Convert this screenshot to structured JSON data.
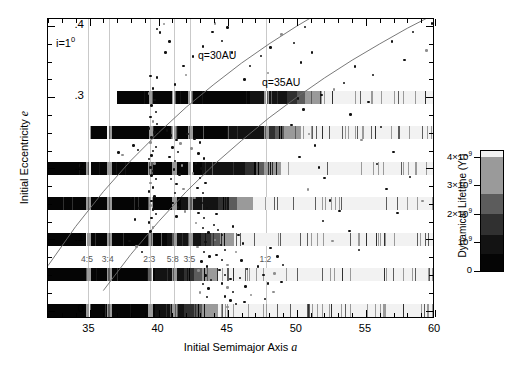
{
  "figure": {
    "x_axis": {
      "title_text": "Initial Semimajor Axis ",
      "title_symbol": "a",
      "min": 32.0,
      "max": 60.0,
      "ticks_major": [
        35,
        40,
        45,
        50,
        55,
        60
      ],
      "tick_labels": [
        "35",
        "40",
        "45",
        "50",
        "55",
        "60"
      ],
      "minor_step": 1
    },
    "y_axis": {
      "title_text": "Initial Eccentricity ",
      "title_symbol": "e",
      "min": -0.012,
      "max": 0.41,
      "ticks_major": [
        0,
        0.1,
        0.2,
        0.3,
        0.4
      ],
      "tick_labels": [
        "0",
        ".1",
        ".2",
        ".3",
        ".4"
      ],
      "minor_step": 0.025
    },
    "annotations": {
      "inclination": "i=1",
      "inclination_exponent": "0",
      "q30_label": "q=30AU",
      "q35_label": "q=35AU"
    },
    "resonance_labels": [
      {
        "text": "4:5",
        "a": 34.9,
        "e": 0.072
      },
      {
        "text": "3:4",
        "a": 36.4,
        "e": 0.072
      },
      {
        "text": "2:3",
        "a": 39.4,
        "e": 0.072
      },
      {
        "text": "5:8",
        "a": 41.1,
        "e": 0.072
      },
      {
        "text": "3:5",
        "a": 42.3,
        "e": 0.072
      },
      {
        "text": "1:2",
        "a": 47.8,
        "e": 0.072
      }
    ],
    "colorbar": {
      "title": "Dynamical Lifetime (Yr)",
      "min": 0,
      "max": 4200000000.0,
      "tick_values": [
        0,
        1000000000.0,
        2000000000.0,
        3000000000.0,
        4000000000.0
      ],
      "tick_labels": [
        "0",
        "10",
        "2×10",
        "3×10",
        "4×10"
      ],
      "tick_exponents": [
        "",
        "9",
        "9",
        "9",
        "9"
      ],
      "bands": [
        {
          "from": 0.0,
          "to": 620000000.0,
          "color": "#050505"
        },
        {
          "from": 620000000.0,
          "to": 1280000000.0,
          "color": "#131313"
        },
        {
          "from": 1280000000.0,
          "to": 2020000000.0,
          "color": "#303030"
        },
        {
          "from": 2020000000.0,
          "to": 2700000000.0,
          "color": "#5c5c5c"
        },
        {
          "from": 2700000000.0,
          "to": 4020000000.0,
          "color": "#9a9a9a"
        },
        {
          "from": 4020000000.0,
          "to": 4200000000.0,
          "color": "#f2f2f2"
        }
      ]
    }
  },
  "chart_data": {
    "type": "scatter",
    "title": "",
    "xlabel": "Initial Semimajor Axis a",
    "ylabel": "Initial Eccentricity e",
    "xlim": [
      32.0,
      60.0
    ],
    "ylim": [
      -0.012,
      0.41
    ],
    "grid": "vertical-resonance-lines",
    "legend": "colorbar-right",
    "resonance_gridlines_a": [
      34.9,
      36.4,
      39.4,
      41.1,
      42.3,
      47.8
    ],
    "curves": [
      {
        "name": "q=30AU",
        "label": "q=30AU",
        "comment": "perihelion q = a(1-e) = 30 AU",
        "q": 30,
        "points_a": [
          32,
          34,
          36,
          38,
          40,
          42,
          44,
          46,
          48,
          50,
          52,
          54,
          56,
          58,
          60
        ],
        "points_e": [
          0.063,
          0.118,
          0.167,
          0.211,
          0.25,
          0.286,
          0.318,
          0.348,
          0.375,
          0.4,
          0.423,
          0.444,
          0.464,
          0.483,
          0.5
        ]
      },
      {
        "name": "q=35AU",
        "label": "q=35AU",
        "comment": "perihelion q = a(1-e) = 35 AU",
        "q": 35,
        "points_a": [
          36,
          38,
          40,
          42,
          44,
          46,
          48,
          50,
          52,
          54,
          56,
          58,
          60
        ],
        "points_e": [
          0.028,
          0.079,
          0.125,
          0.167,
          0.205,
          0.239,
          0.271,
          0.3,
          0.327,
          0.352,
          0.375,
          0.397,
          0.417
        ]
      }
    ],
    "simulation_rows": [
      {
        "e": 0.3,
        "a_start": 37.0,
        "a_black_end": 49.5,
        "a_end": 60.0
      },
      {
        "e": 0.25,
        "a_start": 35.0,
        "a_black_end": 47.9,
        "a_end": 60.0
      },
      {
        "e": 0.2,
        "a_start": 32.0,
        "a_black_end": 46.5,
        "a_end": 60.0
      },
      {
        "e": 0.15,
        "a_start": 32.0,
        "a_black_end": 44.5,
        "a_end": 60.0
      },
      {
        "e": 0.1,
        "a_start": 32.0,
        "a_black_end": 43.2,
        "a_end": 60.0
      },
      {
        "e": 0.05,
        "a_start": 32.0,
        "a_black_end": 42.0,
        "a_end": 60.0
      },
      {
        "e": 0.0,
        "a_start": 32.0,
        "a_black_end": 42.0,
        "a_end": 60.0
      }
    ],
    "observed_objects_note": "Scattered filled circles: dark = classical/resonant KBOs, gray = scattered-disk objects",
    "observed_objects": [
      [
        39.4,
        0.33
      ],
      [
        39.9,
        0.328
      ],
      [
        39.6,
        0.312
      ],
      [
        39.3,
        0.305
      ],
      [
        39.7,
        0.296
      ],
      [
        39.5,
        0.288
      ],
      [
        39.8,
        0.279
      ],
      [
        39.4,
        0.272
      ],
      [
        39.6,
        0.266
      ],
      [
        39.9,
        0.262
      ],
      [
        39.3,
        0.256
      ],
      [
        39.7,
        0.25
      ],
      [
        39.5,
        0.243
      ],
      [
        39.4,
        0.236
      ],
      [
        39.8,
        0.23
      ],
      [
        39.6,
        0.224
      ],
      [
        39.5,
        0.218
      ],
      [
        39.3,
        0.213
      ],
      [
        39.7,
        0.207
      ],
      [
        39.4,
        0.201
      ],
      [
        39.6,
        0.196
      ],
      [
        39.5,
        0.19
      ],
      [
        39.8,
        0.185
      ],
      [
        39.4,
        0.179
      ],
      [
        39.6,
        0.173
      ],
      [
        39.3,
        0.167
      ],
      [
        39.7,
        0.16
      ],
      [
        39.5,
        0.154
      ],
      [
        39.4,
        0.148
      ],
      [
        39.6,
        0.142
      ],
      [
        39.8,
        0.136
      ],
      [
        39.5,
        0.13
      ],
      [
        39.3,
        0.124
      ],
      [
        39.6,
        0.117
      ],
      [
        39.4,
        0.111
      ],
      [
        38.2,
        0.232
      ],
      [
        38.5,
        0.226
      ],
      [
        37.1,
        0.222
      ],
      [
        37.4,
        0.219
      ],
      [
        38.0,
        0.158
      ],
      [
        38.6,
        0.144
      ],
      [
        38.3,
        0.128
      ],
      [
        37.9,
        0.098
      ],
      [
        38.4,
        0.09
      ],
      [
        38.8,
        0.082
      ],
      [
        40.6,
        0.253
      ],
      [
        40.9,
        0.246
      ],
      [
        41.3,
        0.24
      ],
      [
        41.6,
        0.235
      ],
      [
        41.0,
        0.229
      ],
      [
        41.4,
        0.223
      ],
      [
        40.8,
        0.216
      ],
      [
        41.2,
        0.21
      ],
      [
        41.7,
        0.204
      ],
      [
        41.1,
        0.198
      ],
      [
        41.5,
        0.191
      ],
      [
        40.9,
        0.185
      ],
      [
        41.3,
        0.178
      ],
      [
        41.8,
        0.171
      ],
      [
        41.2,
        0.165
      ],
      [
        41.6,
        0.158
      ],
      [
        41.0,
        0.151
      ],
      [
        41.4,
        0.145
      ],
      [
        41.9,
        0.139
      ],
      [
        41.3,
        0.132
      ],
      [
        42.1,
        0.248
      ],
      [
        42.6,
        0.241
      ],
      [
        43.0,
        0.236
      ],
      [
        42.4,
        0.228
      ],
      [
        42.9,
        0.221
      ],
      [
        43.3,
        0.214
      ],
      [
        42.7,
        0.207
      ],
      [
        43.1,
        0.2
      ],
      [
        42.5,
        0.193
      ],
      [
        43.0,
        0.186
      ],
      [
        43.4,
        0.179
      ],
      [
        42.8,
        0.172
      ],
      [
        43.2,
        0.165
      ],
      [
        42.6,
        0.158
      ],
      [
        43.1,
        0.151
      ],
      [
        43.5,
        0.144
      ],
      [
        42.9,
        0.137
      ],
      [
        43.3,
        0.13
      ],
      [
        42.7,
        0.123
      ],
      [
        43.2,
        0.116
      ],
      [
        43.6,
        0.11
      ],
      [
        43.0,
        0.103
      ],
      [
        43.4,
        0.096
      ],
      [
        42.8,
        0.089
      ],
      [
        43.3,
        0.082
      ],
      [
        43.7,
        0.076
      ],
      [
        43.1,
        0.069
      ],
      [
        43.5,
        0.062
      ],
      [
        42.9,
        0.056
      ],
      [
        43.4,
        0.049
      ],
      [
        43.8,
        0.043
      ],
      [
        43.2,
        0.037
      ],
      [
        43.6,
        0.031
      ],
      [
        43.0,
        0.025
      ],
      [
        43.5,
        0.019
      ],
      [
        44.0,
        0.12
      ],
      [
        44.3,
        0.113
      ],
      [
        44.6,
        0.106
      ],
      [
        44.1,
        0.099
      ],
      [
        44.5,
        0.092
      ],
      [
        44.8,
        0.085
      ],
      [
        44.2,
        0.078
      ],
      [
        44.6,
        0.071
      ],
      [
        45.0,
        0.064
      ],
      [
        44.4,
        0.057
      ],
      [
        44.8,
        0.05
      ],
      [
        45.2,
        0.044
      ],
      [
        44.6,
        0.038
      ],
      [
        45.0,
        0.032
      ],
      [
        45.4,
        0.026
      ],
      [
        44.8,
        0.02
      ],
      [
        45.2,
        0.014
      ],
      [
        45.6,
        0.009
      ],
      [
        45.0,
        0.005
      ],
      [
        44.2,
        0.136
      ],
      [
        45.4,
        0.118
      ],
      [
        45.8,
        0.106
      ],
      [
        46.1,
        0.094
      ],
      [
        45.6,
        0.082
      ],
      [
        46.0,
        0.07
      ],
      [
        46.4,
        0.058
      ],
      [
        45.9,
        0.046
      ],
      [
        46.3,
        0.034
      ],
      [
        46.7,
        0.022
      ],
      [
        46.2,
        0.012
      ],
      [
        47.2,
        0.062
      ],
      [
        47.6,
        0.05
      ],
      [
        47.9,
        0.038
      ],
      [
        48.3,
        0.026
      ],
      [
        47.7,
        0.016
      ],
      [
        48.1,
        0.088
      ],
      [
        48.6,
        0.076
      ],
      [
        49.0,
        0.064
      ],
      [
        48.4,
        0.052
      ],
      [
        48.9,
        0.04
      ],
      [
        50.1,
        0.298
      ],
      [
        50.5,
        0.283
      ],
      [
        49.6,
        0.261
      ],
      [
        50.9,
        0.248
      ],
      [
        51.3,
        0.232
      ],
      [
        50.2,
        0.216
      ],
      [
        51.6,
        0.201
      ],
      [
        52.0,
        0.186
      ],
      [
        50.8,
        0.17
      ],
      [
        52.4,
        0.155
      ],
      [
        53.1,
        0.14
      ],
      [
        51.9,
        0.126
      ],
      [
        53.8,
        0.112
      ],
      [
        52.6,
        0.098
      ],
      [
        54.5,
        0.085
      ],
      [
        55.2,
        0.293
      ],
      [
        53.9,
        0.276
      ],
      [
        56.1,
        0.258
      ],
      [
        54.7,
        0.24
      ],
      [
        57.0,
        0.223
      ],
      [
        55.8,
        0.206
      ],
      [
        58.2,
        0.188
      ],
      [
        56.5,
        0.171
      ],
      [
        59.1,
        0.154
      ],
      [
        57.3,
        0.137
      ],
      [
        59.8,
        0.404
      ],
      [
        58.4,
        0.392
      ],
      [
        56.9,
        0.378
      ],
      [
        59.4,
        0.366
      ],
      [
        57.8,
        0.352
      ],
      [
        54.2,
        0.343
      ],
      [
        55.5,
        0.331
      ],
      [
        53.4,
        0.32
      ],
      [
        52.7,
        0.311
      ],
      [
        51.8,
        0.303
      ],
      [
        50.3,
        0.349
      ],
      [
        51.1,
        0.363
      ],
      [
        49.8,
        0.376
      ],
      [
        48.9,
        0.388
      ],
      [
        50.6,
        0.399
      ],
      [
        48.1,
        0.37
      ],
      [
        47.4,
        0.358
      ],
      [
        46.6,
        0.344
      ],
      [
        47.9,
        0.334
      ],
      [
        46.2,
        0.325
      ],
      [
        45.3,
        0.363
      ],
      [
        44.6,
        0.379
      ],
      [
        43.9,
        0.392
      ],
      [
        44.1,
        0.404
      ],
      [
        45.0,
        0.398
      ],
      [
        43.2,
        0.371
      ],
      [
        42.5,
        0.357
      ],
      [
        41.8,
        0.344
      ],
      [
        42.0,
        0.331
      ],
      [
        41.2,
        0.318
      ],
      [
        40.5,
        0.363
      ],
      [
        40.8,
        0.378
      ],
      [
        40.1,
        0.391
      ],
      [
        40.4,
        0.403
      ],
      [
        39.9,
        0.396
      ]
    ]
  }
}
